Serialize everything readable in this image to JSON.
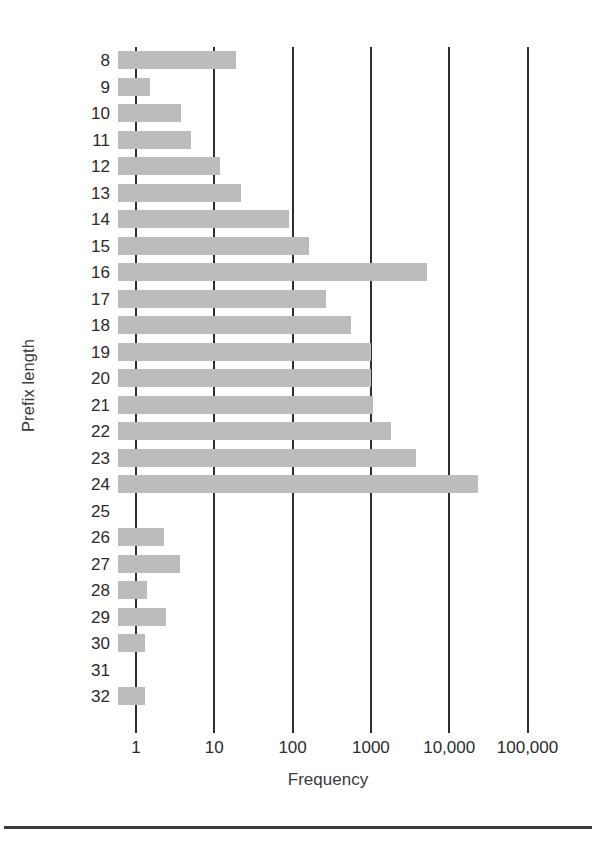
{
  "chart_data": {
    "type": "bar",
    "orientation": "horizontal",
    "title": "",
    "xlabel": "Frequency",
    "ylabel": "Prefix length",
    "xscale": "log",
    "xlim": [
      1,
      100000
    ],
    "xticks": [
      1,
      10,
      100,
      1000,
      10000,
      100000
    ],
    "xticklabels": [
      "1",
      "10",
      "100",
      "1000",
      "10,000",
      "100,000"
    ],
    "grid": "vertical",
    "legend": "none",
    "bar_color": "#bcbcbc",
    "categories": [
      "8",
      "9",
      "10",
      "11",
      "12",
      "13",
      "14",
      "15",
      "16",
      "17",
      "18",
      "19",
      "20",
      "21",
      "22",
      "23",
      "24",
      "25",
      "26",
      "27",
      "28",
      "29",
      "30",
      "31",
      "32"
    ],
    "values": [
      19,
      1.5,
      3.8,
      5,
      12,
      22,
      90,
      160,
      5200,
      265,
      560,
      1000,
      1000,
      1050,
      1800,
      3800,
      23000,
      0,
      2.3,
      3.6,
      1.4,
      2.4,
      1.3,
      0,
      1.3
    ]
  },
  "axes": {
    "y_title": "Prefix length",
    "x_title": "Frequency",
    "x_ticks": [
      {
        "value": 1,
        "label": "1"
      },
      {
        "value": 10,
        "label": "10"
      },
      {
        "value": 100,
        "label": "100"
      },
      {
        "value": 1000,
        "label": "1000"
      },
      {
        "value": 10000,
        "label": "10,000"
      },
      {
        "value": 100000,
        "label": "100,000"
      }
    ]
  },
  "colors": {
    "bar": "#bcbcbc",
    "gridline": "#2e2e2e",
    "text": "#2b2b2b",
    "rule": "#3a3a3a"
  }
}
